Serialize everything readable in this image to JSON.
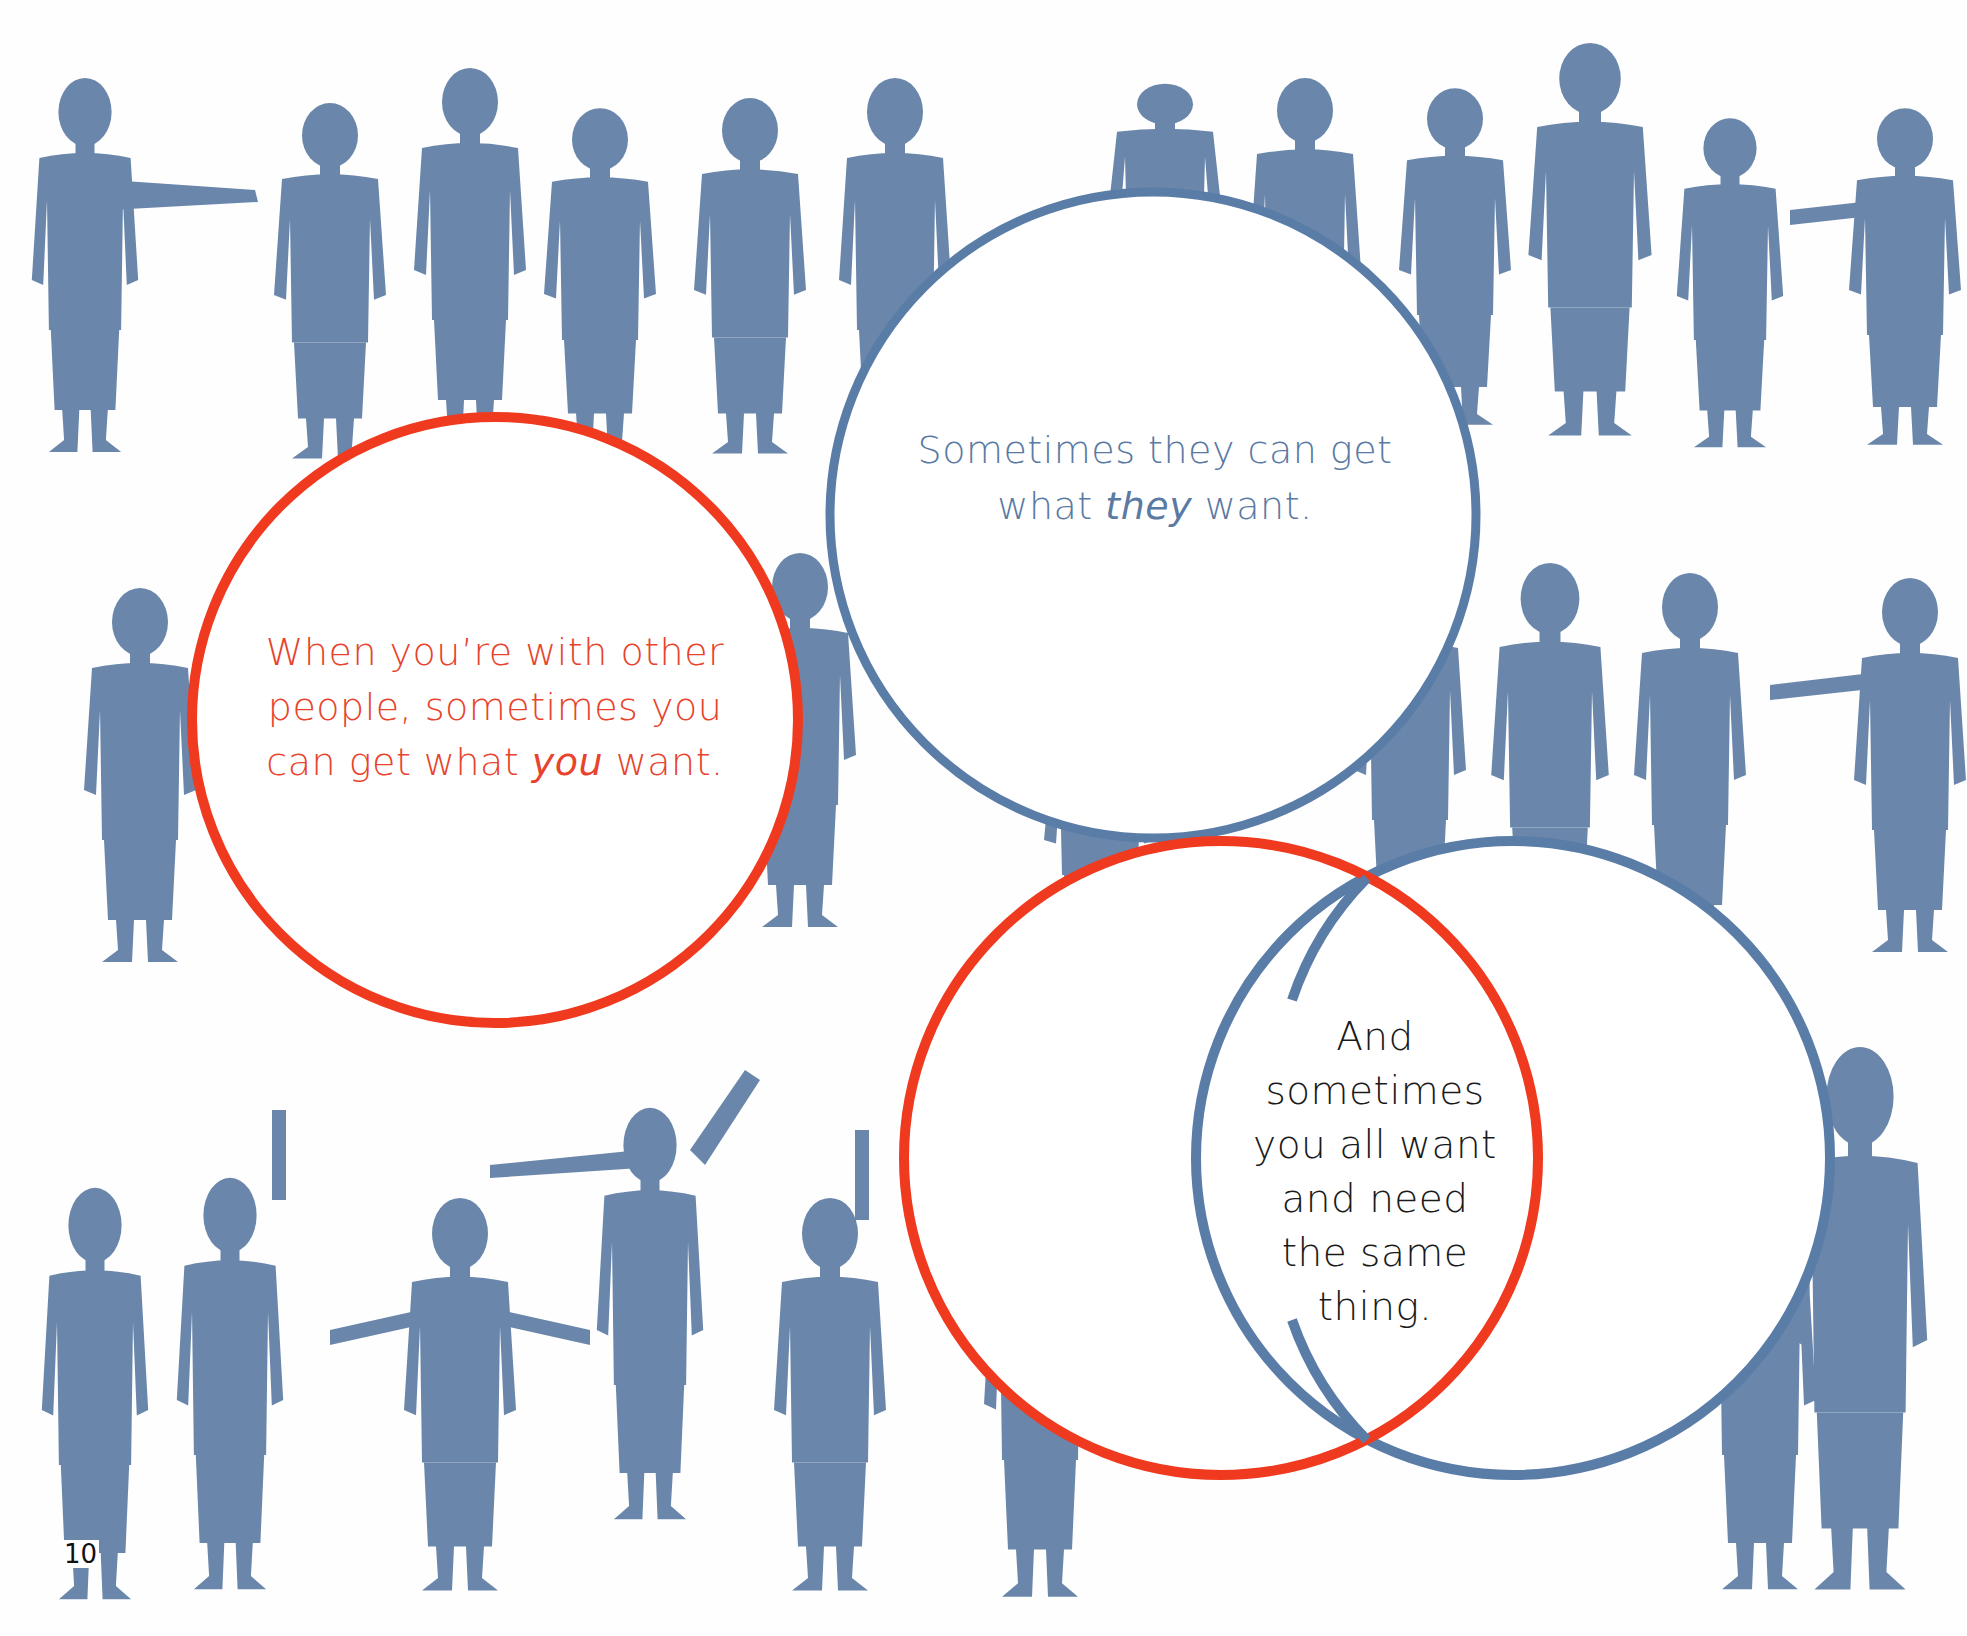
{
  "page": {
    "page_number": "10",
    "colors": {
      "background": "#ffffff",
      "silhouette": "#6a87ab",
      "red_accent": "#f03a1f",
      "blue_accent": "#5a7da8",
      "red_text": "#e8432c",
      "blue_text": "#5a7aa3",
      "black_text": "#1a1a1a"
    }
  },
  "circles": {
    "you": {
      "line1": "When you’re with other",
      "line2": "people, sometimes you",
      "line3_pre": "can get what ",
      "line3_em": "you",
      "line3_post": " want."
    },
    "they": {
      "line1": "Sometimes they can get",
      "line2_pre": "what ",
      "line2_em": "they",
      "line2_post": " want."
    },
    "overlap": {
      "lines": [
        "And",
        "sometimes",
        "you all want",
        "and need",
        "the same",
        "thing."
      ]
    }
  },
  "diagram": {
    "type": "venn",
    "sets": [
      {
        "name": "you",
        "color": "red"
      },
      {
        "name": "they",
        "color": "blue"
      }
    ],
    "intersection_label": "you all want and need the same thing"
  }
}
